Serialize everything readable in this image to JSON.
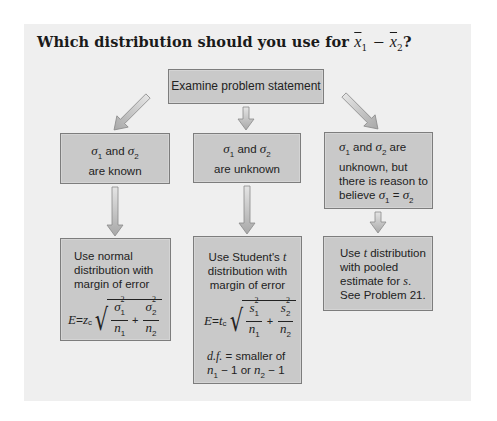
{
  "title": {
    "prefix": "Which distribution should you use for",
    "x1": "x",
    "x1_sub": "1",
    "minus": "−",
    "x2": "x",
    "x2_sub": "2",
    "suffix": "?"
  },
  "top_box": {
    "label": "Examine problem statement"
  },
  "conditions": [
    {
      "line1_a": "σ",
      "line1_sub": "1",
      "line1_b": " and ",
      "line1_c": "σ",
      "line1_sub2": "2",
      "line2": "are known"
    },
    {
      "line1_a": "σ",
      "line1_sub": "1",
      "line1_b": " and ",
      "line1_c": "σ",
      "line1_sub2": "2",
      "line2": "are unknown"
    },
    {
      "line1_a": "σ",
      "line1_sub": "1",
      "line1_b": " and ",
      "line1_c": "σ",
      "line1_sub2": "2",
      "line1_d": " are",
      "line2": "unknown, but",
      "line3": "there is reason to",
      "line4_a": "believe ",
      "line4_b": "σ",
      "line4_sub": "1",
      "line4_eq": " = ",
      "line4_c": "σ",
      "line4_sub2": "2"
    }
  ],
  "results": [
    {
      "lines": [
        "Use normal",
        "distribution with",
        "margin of error"
      ],
      "formula": {
        "lhs": "E",
        "eq": " = ",
        "crit": "z",
        "crit_sub": "c",
        "num1": "σ",
        "num1_sup": "2",
        "num1_sub": "1",
        "den1": "n",
        "den1_sub": "1",
        "plus": "+",
        "num2": "σ",
        "num2_sup": "2",
        "num2_sub": "2",
        "den2": "n",
        "den2_sub": "2"
      }
    },
    {
      "lines_a": "Use Student's ",
      "lines_t": "t",
      "lines": [
        "distribution with",
        "margin of error"
      ],
      "formula": {
        "lhs": "E",
        "eq": " = ",
        "crit": "t",
        "crit_sub": "c",
        "num1": "s",
        "num1_sup": "2",
        "num1_sub": "1",
        "den1": "n",
        "den1_sub": "1",
        "plus": "+",
        "num2": "s",
        "num2_sup": "2",
        "num2_sub": "2",
        "den2": "n",
        "den2_sub": "2"
      },
      "df_label": "d.f.",
      "df_text": " = smaller of",
      "df_line2_a": "n",
      "df_line2_sub1": "1",
      "df_line2_b": " − 1 or ",
      "df_line2_c": "n",
      "df_line2_sub2": "2",
      "df_line2_d": " − 1"
    },
    {
      "line1_a": "Use ",
      "line1_t": "t",
      "line1_b": " distribution",
      "line2": "with pooled",
      "line3_a": "estimate for ",
      "line3_s": "s",
      "line3_b": ".",
      "line4": "See Problem 21."
    }
  ],
  "colors": {
    "panel": "#efefef",
    "box_fill": "#c9c9c9",
    "box_border": "#7d7d7d",
    "arrow_fill": "#c4c4c4",
    "arrow_stroke": "#8a8a8a"
  }
}
